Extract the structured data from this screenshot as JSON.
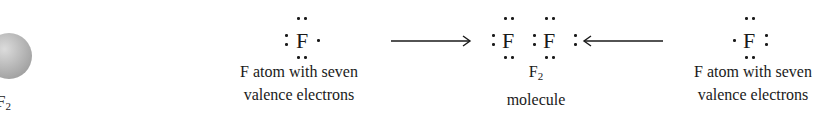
{
  "left_panel": {
    "molecule_label": "F",
    "molecule_subscript": "2"
  },
  "left_atom": {
    "symbol": "F",
    "caption_line1": "F atom with seven",
    "caption_line2": "valence electrons"
  },
  "product": {
    "symbol1": "F",
    "symbol2": "F",
    "formula": "F",
    "formula_subscript": "2",
    "caption": "molecule"
  },
  "right_atom": {
    "symbol": "F",
    "caption_line1": "F atom with seven",
    "caption_line2": "valence electrons"
  },
  "arrows": {
    "left_arrow": "right-arrow",
    "right_arrow": "left-arrow"
  }
}
